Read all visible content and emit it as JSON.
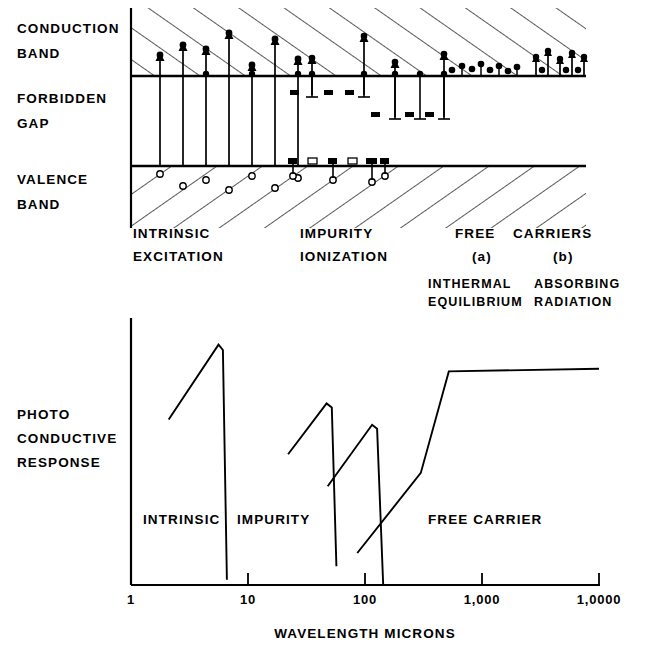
{
  "figure": {
    "title": "",
    "band_diagram": {
      "axis_labels": {
        "conduction_band_line1": "CONDUCTION",
        "conduction_band_line2": "BAND",
        "forbidden_gap_line1": "FORBIDDEN",
        "forbidden_gap_line2": "GAP",
        "valence_band_line1": "VALENCE",
        "valence_band_line2": "BAND"
      },
      "process_labels": [
        {
          "line1": "INTRINSIC",
          "line2": "EXCITATION"
        },
        {
          "line1": "IMPURITY",
          "line2": "IONIZATION"
        },
        {
          "line1": "FREE",
          "line2": "CARRIERS"
        }
      ],
      "free_carrier_sublabels": [
        {
          "tag": "(a)",
          "line1": "INTHERMAL",
          "line2": "EQUILIBRIUM"
        },
        {
          "tag": "(b)",
          "line1": "ABSORBING",
          "line2": "RADIATION"
        }
      ]
    },
    "response_plot": {
      "ylabel_line1": "PHOTO",
      "ylabel_line2": "CONDUCTIVE",
      "ylabel_line3": "RESPONSE",
      "xlabel": "WAVELENGTH  MICRONS",
      "region_labels": [
        "INTRINSIC",
        "IMPURITY",
        "FREE CARRIER"
      ]
    },
    "colors": {
      "ink": "#000000",
      "paper": "#ffffff"
    }
  },
  "chart_data": {
    "type": "line",
    "xlabel": "WAVELENGTH MICRONS",
    "ylabel": "PHOTO CONDUCTIVE RESPONSE",
    "xscale": "log",
    "xlim": [
      1,
      10000
    ],
    "xticks": [
      1,
      10,
      100,
      1000,
      10000
    ],
    "xticklabels": [
      "1",
      "10",
      "100",
      "1,000",
      "1,0000"
    ],
    "ylim": [
      0,
      1
    ],
    "yticks": [],
    "grid": false,
    "legend": false,
    "annotations": [
      {
        "text": "INTRINSIC",
        "x": 2.6,
        "y": 0.21
      },
      {
        "text": "IMPURITY",
        "x": 13.0,
        "y": 0.21
      },
      {
        "text": "FREE CARRIER",
        "x": 560,
        "y": 0.21
      }
    ],
    "series": [
      {
        "name": "INTRINSIC",
        "x": [
          2.1,
          5.6,
          6.1,
          6.6
        ],
        "y": [
          0.62,
          0.9,
          0.88,
          0.02
        ]
      },
      {
        "name": "IMPURITY",
        "x": [
          22,
          47,
          52,
          57
        ],
        "y": [
          0.49,
          0.68,
          0.665,
          0.07
        ]
      },
      {
        "name": "IMPURITY-2",
        "x": [
          48,
          115,
          127,
          143
        ],
        "y": [
          0.37,
          0.6,
          0.585,
          0.0
        ]
      },
      {
        "name": "FREE CARRIER",
        "x": [
          86,
          300,
          520,
          10000
        ],
        "y": [
          0.12,
          0.42,
          0.8,
          0.81
        ]
      }
    ]
  },
  "band_particles": {
    "intrinsic_transitions_x": [
      160,
      183,
      206,
      229,
      252,
      275
    ],
    "impurity_upward_x": [
      300,
      335,
      368
    ],
    "impurity_downward_x": [
      322,
      352,
      400,
      425,
      447
    ],
    "donor_levels_x": [
      292,
      312,
      333,
      354
    ],
    "acceptor_levels_x": [
      300,
      322,
      345,
      362
    ],
    "free_carrier_a_x": [
      455,
      465,
      477,
      488,
      500,
      510,
      520
    ],
    "free_carrier_b_x": [
      540,
      552,
      563,
      574,
      585
    ]
  },
  "icons": {
    "electron": "filled-circle",
    "hole": "open-circle",
    "arrow_up": "up-arrow",
    "arrow_down": "down-arrow",
    "donor_level": "filled-square",
    "acceptor_level": "open-square"
  }
}
